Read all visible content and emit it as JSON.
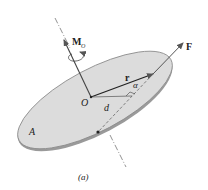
{
  "figure": {
    "caption": "(a)",
    "labels": {
      "moment": "M",
      "moment_subscript": "O",
      "force": "F",
      "position": "r",
      "origin": "O",
      "distance": "d",
      "angle": "α",
      "plane": "A"
    },
    "colors": {
      "plane_fill": "#dcdcdc",
      "plane_edge": "#8a8a8a",
      "ink": "#333333",
      "background": "#ffffff"
    }
  }
}
